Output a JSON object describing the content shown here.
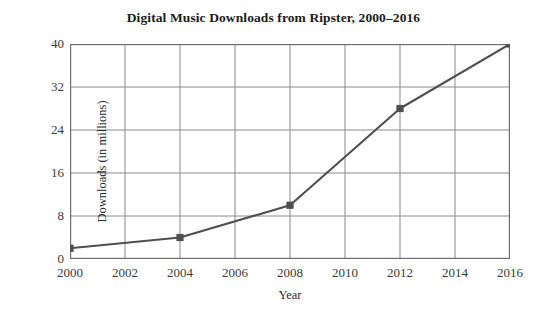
{
  "chart_data": {
    "type": "line",
    "title": "Digital Music Downloads from Ripster, 2000–2016",
    "xlabel": "Year",
    "ylabel": "Downloads (in millions)",
    "x": [
      2000,
      2004,
      2008,
      2012,
      2016
    ],
    "values": [
      2,
      4,
      10,
      28,
      40
    ],
    "series": [
      {
        "name": "Downloads",
        "x": [
          2000,
          2004,
          2008,
          2012,
          2016
        ],
        "values": [
          2,
          4,
          10,
          28,
          40
        ]
      }
    ],
    "xlim": [
      2000,
      2016
    ],
    "ylim": [
      0,
      40
    ],
    "xticks": [
      2000,
      2002,
      2004,
      2006,
      2008,
      2010,
      2012,
      2014,
      2016
    ],
    "xtick_labels": [
      "2000",
      "2002",
      "2004",
      "2006",
      "2008",
      "2010",
      "2012",
      "2014",
      "2016"
    ],
    "yticks": [
      0,
      8,
      16,
      24,
      32,
      40
    ],
    "ytick_labels": [
      "0",
      "8",
      "16",
      "24",
      "32",
      "40"
    ],
    "grid": true,
    "legend": false,
    "marker": "square",
    "line_color": "#4f4f4f",
    "marker_color": "#4f4f4f",
    "grid_color": "#8a8a8a",
    "axis_color": "#6e6e6e",
    "background": "#ffffff"
  }
}
